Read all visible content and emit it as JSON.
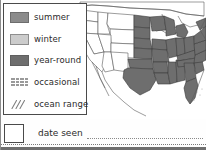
{
  "legend": {
    "items": [
      {
        "label": "summer",
        "swatch": "solid-swatch",
        "color": "#8b8b8b"
      },
      {
        "label": "winter",
        "swatch": "solid-swatch",
        "color": "#cccccc"
      },
      {
        "label": "year-round",
        "swatch": "solid-swatch",
        "color": "#6e6e6e"
      },
      {
        "label": "occasional",
        "swatch": "stipple-swatch",
        "color": "#9a9a9a"
      },
      {
        "label": "ocean range",
        "swatch": "hatch-swatch",
        "color": "#8a8a8a"
      }
    ]
  },
  "date_seen": {
    "label": "date seen",
    "checkbox_value": ""
  },
  "map": {
    "region_name": "United States",
    "shaded_range": "year-round",
    "shaded_color": "#6e6e6e",
    "unshaded_color": "#ffffff",
    "border_color": "#555555"
  }
}
